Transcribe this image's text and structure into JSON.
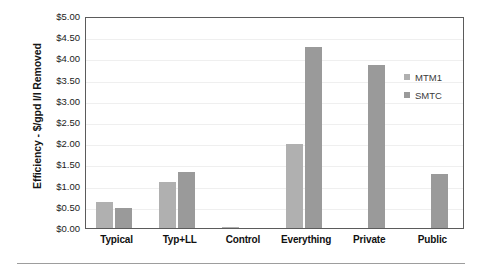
{
  "chart_data": {
    "type": "bar",
    "title": "",
    "xlabel": "",
    "ylabel": "Efficiency - $/gpd I/I Removed",
    "ylim": [
      0,
      5
    ],
    "ytick_step": 0.5,
    "ytick_labels": [
      "$5.00",
      "$4.50",
      "$4.00",
      "$3.50",
      "$3.00",
      "$2.50",
      "$2.00",
      "$1.50",
      "$1.00",
      "$0.50",
      "$0.00"
    ],
    "ytick_values": [
      5.0,
      4.5,
      4.0,
      3.5,
      3.0,
      2.5,
      2.0,
      1.5,
      1.0,
      0.5,
      0.0
    ],
    "grid": true,
    "legend_position": "right",
    "categories": [
      "Typical",
      "Typ+LL",
      "Control",
      "Everything",
      "Private",
      "Public"
    ],
    "series": [
      {
        "name": "MTM1",
        "color": "#b0b0b0",
        "values": [
          0.63,
          1.1,
          0.04,
          2.0,
          null,
          null
        ]
      },
      {
        "name": "SMTC",
        "color": "#9a9a9a",
        "values": [
          0.5,
          1.35,
          null,
          4.3,
          3.87,
          1.3
        ]
      }
    ]
  },
  "legend": {
    "items": [
      {
        "label": "MTM1",
        "color": "#b0b0b0"
      },
      {
        "label": "SMTC",
        "color": "#9a9a9a"
      }
    ]
  },
  "axis": {
    "y_title": "Efficiency - $/gpd I/I Removed"
  },
  "colors": {
    "series_1": "#b0b0b0",
    "series_2": "#9a9a9a",
    "axis_line": "#5b5b5b",
    "gridline": "#efefef",
    "rule": "#9d9d9d",
    "text": "#111111"
  }
}
